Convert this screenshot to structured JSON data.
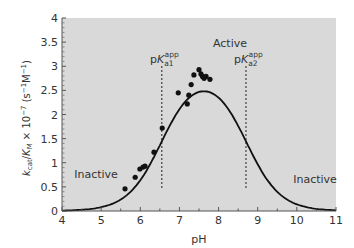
{
  "chart_data": {
    "type": "scatter",
    "title": "",
    "xlabel": "pH",
    "ylabel": "k_cat/K_M × 10^-7 (s^-1 M^-1)",
    "xlim": [
      4,
      11
    ],
    "ylim": [
      0,
      4
    ],
    "x_ticks": [
      4,
      5,
      6,
      7,
      8,
      9,
      10,
      11
    ],
    "y_ticks": [
      0,
      0.5,
      1,
      1.5,
      2,
      2.5,
      3,
      3.5,
      4
    ],
    "x_tick_labels": [
      "4",
      "5",
      "6",
      "7",
      "8",
      "9",
      "10",
      "11"
    ],
    "y_tick_labels": [
      "0",
      "0.5",
      "1",
      "1.5",
      "2",
      "2.5",
      "3",
      "3.5",
      "4"
    ],
    "grid": false,
    "background": "#d9d9d9",
    "series": [
      {
        "name": "measured",
        "kind": "scatter",
        "x": [
          5.61,
          5.87,
          5.99,
          6.07,
          6.12,
          6.35,
          6.56,
          6.97,
          7.2,
          7.3,
          7.24,
          7.37,
          7.55,
          7.5,
          7.63,
          7.59,
          7.68,
          7.78
        ],
        "y": [
          0.46,
          0.7,
          0.87,
          0.91,
          0.93,
          1.22,
          1.72,
          2.45,
          2.22,
          2.62,
          2.4,
          2.82,
          2.84,
          2.93,
          2.75,
          2.79,
          2.79,
          2.73
        ]
      },
      {
        "name": "fit",
        "kind": "line",
        "model": "bell-shaped double pKa fit",
        "params": {
          "kmax": 2.9,
          "pKa1": 6.55,
          "pKa2": 8.7
        },
        "x": [
          4.0,
          4.5,
          5.0,
          5.5,
          6.0,
          6.25,
          6.5,
          6.75,
          7.0,
          7.25,
          7.5,
          7.63,
          7.75,
          8.0,
          8.25,
          8.5,
          8.75,
          9.0,
          9.5,
          10.0,
          10.5,
          11.0
        ],
        "y": [
          0.01,
          0.03,
          0.1,
          0.3,
          0.71,
          1.01,
          1.35,
          1.77,
          2.15,
          2.45,
          2.66,
          2.71,
          2.72,
          2.6,
          2.32,
          1.85,
          1.38,
          0.95,
          0.45,
          0.2,
          0.08,
          0.03
        ]
      }
    ],
    "reference_lines": [
      {
        "orientation": "vertical",
        "x": 6.55,
        "style": "dashed",
        "label": "pK_a1^app"
      },
      {
        "orientation": "vertical",
        "x": 8.7,
        "style": "dashed",
        "label": "pK_a2^app"
      }
    ],
    "annotations": [
      {
        "text": "Active",
        "x": 7.6,
        "y": 3.35
      },
      {
        "text": "Inactive",
        "x": 4.9,
        "y": 0.95
      },
      {
        "text": "Inactive",
        "x": 10.1,
        "y": 0.45
      }
    ]
  },
  "labels": {
    "xlabel": "pH",
    "ylabel_k": "k",
    "ylabel_cat": "cat",
    "ylabel_slash": "/",
    "ylabel_K": "K",
    "ylabel_M": "M",
    "ylabel_rest": " × 10",
    "ylabel_exp": "−7",
    "ylabel_units": " (s",
    "ylabel_units_exp1": "−1",
    "ylabel_units_M": "M",
    "ylabel_units_exp2": "−1",
    "ylabel_close": ")",
    "active": "Active",
    "inactive_left": "Inactive",
    "inactive_right": "Inactive",
    "pka1_p": "p",
    "pka1_K": "K",
    "pka1_sub": "a1",
    "pka1_sup": "app",
    "pka2_p": "p",
    "pka2_K": "K",
    "pka2_sub": "a2",
    "pka2_sup": "app"
  }
}
